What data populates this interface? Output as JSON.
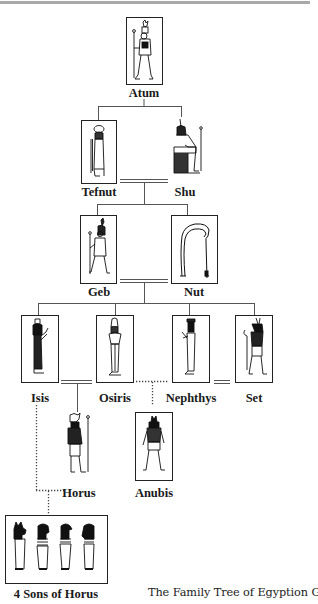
{
  "diagram": {
    "title": "The Family Tree of Egyption Gods",
    "type": "family-tree",
    "nodes": [
      {
        "id": "atum",
        "label": "Atum",
        "boxed": true,
        "icon": "standing-god-with-crown-and-staff"
      },
      {
        "id": "tefnut",
        "label": "Tefnut",
        "boxed": true,
        "icon": "lioness-goddess-with-sun-disk"
      },
      {
        "id": "shu",
        "label": "Shu",
        "boxed": false,
        "icon": "seated-god-with-feather"
      },
      {
        "id": "geb",
        "label": "Geb",
        "boxed": true,
        "icon": "standing-god-with-staff"
      },
      {
        "id": "nut",
        "label": "Nut",
        "boxed": true,
        "icon": "arched-sky-goddess"
      },
      {
        "id": "isis",
        "label": "Isis",
        "boxed": true,
        "icon": "goddess-with-throne-crown"
      },
      {
        "id": "osiris",
        "label": "Osiris",
        "boxed": true,
        "icon": "mummified-god-with-atef-crown"
      },
      {
        "id": "nephthys",
        "label": "Nephthys",
        "boxed": true,
        "icon": "goddess-with-house-basket-crown"
      },
      {
        "id": "set",
        "label": "Set",
        "boxed": true,
        "icon": "set-animal-headed-god"
      },
      {
        "id": "horus",
        "label": "Horus",
        "boxed": false,
        "icon": "falcon-headed-god-with-double-crown"
      },
      {
        "id": "anubis",
        "label": "Anubis",
        "boxed": true,
        "icon": "jackal-headed-god"
      },
      {
        "id": "four-sons",
        "label": "4 Sons of Horus",
        "boxed": true,
        "icon": "four-canopic-figures"
      }
    ],
    "edges": [
      {
        "from": "atum",
        "to": [
          "tefnut",
          "shu"
        ],
        "type": "parent"
      },
      {
        "from": "tefnut",
        "to": "shu",
        "type": "marriage",
        "style": "double-line"
      },
      {
        "from": [
          "tefnut",
          "shu"
        ],
        "to": [
          "geb",
          "nut"
        ],
        "type": "parent"
      },
      {
        "from": "geb",
        "to": "nut",
        "type": "marriage",
        "style": "double-line"
      },
      {
        "from": [
          "geb",
          "nut"
        ],
        "to": [
          "isis",
          "osiris",
          "nephthys",
          "set"
        ],
        "type": "parent"
      },
      {
        "from": "isis",
        "to": "osiris",
        "type": "marriage",
        "style": "double-line"
      },
      {
        "from": [
          "isis",
          "osiris"
        ],
        "to": "horus",
        "type": "parent"
      },
      {
        "from": "osiris",
        "to": "nephthys",
        "type": "union",
        "style": "dotted"
      },
      {
        "from": [
          "osiris",
          "nephthys"
        ],
        "to": "anubis",
        "type": "parent",
        "style": "dotted"
      },
      {
        "from": "nephthys",
        "to": "set",
        "type": "marriage",
        "style": "double-line"
      },
      {
        "from": [
          "isis",
          "horus"
        ],
        "to": "four-sons",
        "type": "parent",
        "style": "dotted"
      }
    ]
  },
  "colors": {
    "line": "#555555",
    "box_border": "#222222",
    "rule": "#a9a9a9",
    "text": "#1a1a1a",
    "background": "#ffffff"
  }
}
